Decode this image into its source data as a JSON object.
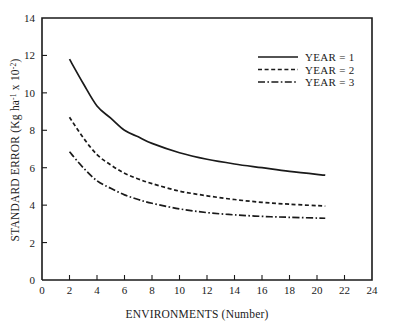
{
  "chart_data": {
    "type": "line",
    "title": "",
    "xlabel": "ENVIRONMENTS (Number)",
    "ylabel_main": "STANDARD ERROR (Kg ha",
    "ylabel_sup1": "-1",
    "ylabel_mid": " x 10",
    "ylabel_sup2": "-2",
    "ylabel_end": ")",
    "ylabel_full": "STANDARD ERROR (Kg ha-1 x 10-2)",
    "xlim": [
      0,
      24
    ],
    "ylim": [
      0,
      14
    ],
    "xticks": [
      0,
      2,
      4,
      6,
      8,
      10,
      12,
      14,
      16,
      18,
      20,
      22,
      24
    ],
    "yticks": [
      0,
      2,
      4,
      6,
      8,
      10,
      12,
      14
    ],
    "xtick_labels": [
      "0",
      "2",
      "4",
      "6",
      "8",
      "10",
      "12",
      "14",
      "16",
      "18",
      "20",
      "22",
      "24"
    ],
    "ytick_labels": [
      "0",
      "2",
      "4",
      "6",
      "8",
      "10",
      "12",
      "14"
    ],
    "grid": false,
    "legend_position": "top-right",
    "series": [
      {
        "name": "YEAR = 1",
        "style": "solid",
        "x": [
          2.0,
          3.0,
          4.0,
          5.0,
          6.0,
          7.0,
          8.0,
          10.0,
          12.0,
          14.0,
          16.0,
          18.0,
          20.6
        ],
        "values": [
          11.8,
          10.5,
          9.3,
          8.65,
          8.0,
          7.65,
          7.3,
          6.8,
          6.45,
          6.2,
          6.0,
          5.8,
          5.6
        ]
      },
      {
        "name": "YEAR = 2",
        "style": "dashed",
        "x": [
          2.0,
          3.0,
          4.0,
          5.0,
          6.0,
          7.0,
          8.0,
          10.0,
          12.0,
          14.0,
          16.0,
          18.0,
          20.6
        ],
        "values": [
          8.7,
          7.6,
          6.7,
          6.15,
          5.7,
          5.4,
          5.15,
          4.75,
          4.5,
          4.3,
          4.15,
          4.05,
          3.95
        ]
      },
      {
        "name": "YEAR = 3",
        "style": "dashdot",
        "x": [
          2.0,
          3.0,
          4.0,
          5.0,
          6.0,
          7.0,
          8.0,
          10.0,
          12.0,
          14.0,
          16.0,
          18.0,
          20.6
        ],
        "values": [
          6.85,
          6.0,
          5.3,
          4.9,
          4.55,
          4.3,
          4.1,
          3.8,
          3.6,
          3.48,
          3.4,
          3.35,
          3.3
        ]
      }
    ]
  },
  "legend": {
    "items": [
      {
        "label": "YEAR = 1",
        "style": "solid"
      },
      {
        "label": "YEAR = 2",
        "style": "dashed"
      },
      {
        "label": "YEAR = 3",
        "style": "dashdot"
      }
    ]
  },
  "colors": {
    "ink": "#1a1a1a",
    "background": "#ffffff"
  }
}
